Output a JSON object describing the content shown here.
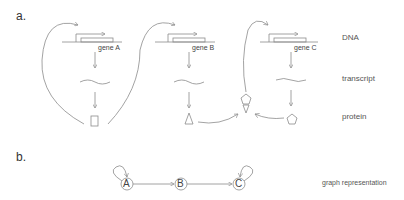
{
  "panels": {
    "a": {
      "label": "a."
    },
    "b": {
      "label": "b."
    }
  },
  "row_labels": {
    "dna": "DNA",
    "transcript": "transcript",
    "protein": "protein",
    "graph": "graph representation"
  },
  "genes": [
    {
      "name": "gene A",
      "protein_shape": "rectangle"
    },
    {
      "name": "gene B",
      "protein_shape": "triangle"
    },
    {
      "name": "gene C",
      "protein_shape": "pentagon"
    }
  ],
  "complex": {
    "shape": "pentagon-triangle-complex"
  },
  "graph": {
    "nodes": [
      "A",
      "B",
      "C"
    ],
    "edges": [
      [
        "A",
        "A"
      ],
      [
        "A",
        "B"
      ],
      [
        "B",
        "C"
      ],
      [
        "C",
        "C"
      ]
    ]
  },
  "colors": {
    "line": "#8c8c8c",
    "text": "#555555"
  }
}
